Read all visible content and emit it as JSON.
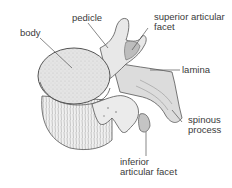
{
  "diagram": {
    "colors": {
      "bone_fill": "#e6e6e6",
      "bone_shade": "#b8b8b8",
      "outline": "#555555",
      "leader_line": "#555555",
      "text": "#3a3a3a",
      "background": "#ffffff"
    },
    "labels": {
      "body": "body",
      "pedicle": "pedicle",
      "superior_articular_facet_1": "superior articular",
      "superior_articular_facet_2": "facet",
      "lamina": "lamina",
      "spinous_process_1": "spinous",
      "spinous_process_2": "process",
      "inferior_articular_facet_1": "inferior",
      "inferior_articular_facet_2": "articular facet"
    }
  }
}
